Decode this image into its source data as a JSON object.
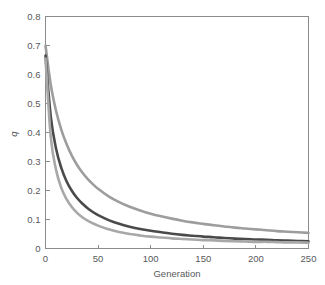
{
  "chart_data": {
    "type": "line",
    "title": "",
    "xlabel": "Generation",
    "ylabel": "q",
    "xlim": [
      0,
      250
    ],
    "ylim": [
      0,
      0.8
    ],
    "grid": false,
    "legend": "none",
    "background_color": "#ffffff",
    "axis_color": "#8c8c8c",
    "text_color": "#58595b",
    "xticks": [
      0,
      50,
      100,
      150,
      200,
      250
    ],
    "xtick_labels": [
      "0",
      "50",
      "100",
      "150",
      "200",
      "250"
    ],
    "yticks": [
      0,
      0.1,
      0.2,
      0.3,
      0.4,
      0.5,
      0.6,
      0.7,
      0.8
    ],
    "ytick_labels": [
      "0",
      "0.1",
      "0.2",
      "0.3",
      "0.4",
      "0.5",
      "0.6",
      "0.7",
      "0.8"
    ],
    "x": [
      0,
      5,
      10,
      15,
      20,
      25,
      30,
      35,
      40,
      45,
      50,
      60,
      70,
      80,
      90,
      100,
      110,
      120,
      130,
      140,
      150,
      160,
      170,
      180,
      190,
      200,
      210,
      220,
      230,
      240,
      250
    ],
    "series": [
      {
        "name": "slow-decay",
        "color": "#9d9d9d",
        "width": 2.6,
        "values": [
          0.7,
          0.565,
          0.475,
          0.41,
          0.36,
          0.32,
          0.288,
          0.262,
          0.24,
          0.222,
          0.206,
          0.18,
          0.16,
          0.144,
          0.131,
          0.12,
          0.111,
          0.103,
          0.096,
          0.09,
          0.085,
          0.08,
          0.076,
          0.072,
          0.069,
          0.066,
          0.063,
          0.06,
          0.058,
          0.056,
          0.054
        ]
      },
      {
        "name": "medium-decay",
        "color": "#4a4a4a",
        "width": 2.6,
        "values": [
          0.665,
          0.455,
          0.345,
          0.278,
          0.232,
          0.199,
          0.174,
          0.155,
          0.139,
          0.126,
          0.115,
          0.098,
          0.085,
          0.075,
          0.067,
          0.061,
          0.056,
          0.051,
          0.047,
          0.044,
          0.041,
          0.039,
          0.036,
          0.034,
          0.033,
          0.031,
          0.03,
          0.028,
          0.027,
          0.026,
          0.025
        ]
      },
      {
        "name": "fast-decay",
        "color": "#a8a8a8",
        "width": 2.6,
        "values": [
          0.655,
          0.385,
          0.272,
          0.209,
          0.17,
          0.143,
          0.123,
          0.108,
          0.096,
          0.087,
          0.079,
          0.066,
          0.057,
          0.05,
          0.045,
          0.041,
          0.038,
          0.035,
          0.033,
          0.031,
          0.029,
          0.028,
          0.026,
          0.025,
          0.024,
          0.023,
          0.023,
          0.022,
          0.021,
          0.021,
          0.02
        ]
      }
    ]
  }
}
